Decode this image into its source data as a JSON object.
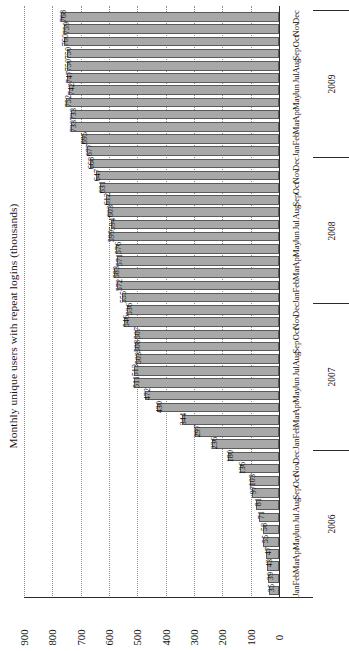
{
  "chart": {
    "type": "bar",
    "orientation": "horizontal-rotated",
    "axis_title": "Monthly unique users with repeat logins (thousands)"
  },
  "axis": {
    "ticks": [
      "0",
      "100",
      "200",
      "300",
      "400",
      "500",
      "600",
      "700",
      "800",
      "900"
    ],
    "min": 0,
    "max": 900,
    "step": 100
  },
  "year_groups": [
    {
      "label": "2006"
    },
    {
      "label": "2007"
    },
    {
      "label": "2008"
    },
    {
      "label": "2009"
    }
  ],
  "colors": {
    "bar_fill": "#a8a8a8",
    "bar_stroke": "#5b5b5b",
    "grid": "#8d8d8d",
    "axis": "#2b2b2b",
    "text": "#111111",
    "background": "#ffffff"
  },
  "chart_data": {
    "type": "bar",
    "title": "",
    "xlabel": "",
    "ylabel": "Monthly unique users with repeat logins (thousands)",
    "ylim": [
      0,
      900
    ],
    "grid": true,
    "legend": "none",
    "categories": [
      "Jan 2006",
      "Feb 2006",
      "Mar 2006",
      "Apr 2006",
      "May 2006",
      "Jun 2006",
      "Jul 2006",
      "Aug 2006",
      "Sep 2006",
      "Oct 2006",
      "Nov 2006",
      "Dec 2006",
      "Jan 2007",
      "Feb 2007",
      "Mar 2007",
      "Apr 2007",
      "May 2007",
      "Jun 2007",
      "Jul 2007",
      "Aug 2007",
      "Sep 2007",
      "Oct 2007",
      "Nov 2007",
      "Dec 2007",
      "Jan 2008",
      "Feb 2008",
      "Mar 2008",
      "Apr 2008",
      "May 2008",
      "Jun 2008",
      "Jul 2008",
      "Aug 2008",
      "Sep 2008",
      "Oct 2008",
      "Nov 2008",
      "Dec 2008",
      "Jan 2009",
      "Feb 2009",
      "Mar 2009",
      "Apr 2009",
      "May 2009",
      "Jun 2009",
      "Jul 2009",
      "Aug 2009",
      "Sep 2009",
      "Oct 2009",
      "Nov 2009",
      "Dec 2009"
    ],
    "values": [
      35,
      39,
      43,
      47,
      55,
      58,
      71,
      81,
      97,
      103,
      136,
      180,
      236,
      297,
      344,
      430,
      472,
      511,
      513,
      503,
      508,
      507,
      546,
      536,
      555,
      572,
      583,
      571,
      576,
      599,
      594,
      603,
      612,
      631,
      647,
      668,
      677,
      695,
      733,
      733,
      752,
      742,
      747,
      750,
      750,
      760,
      759,
      768
    ],
    "months": [
      "Jan",
      "Feb",
      "Mar",
      "Apr",
      "May",
      "Jun",
      "Jul",
      "Aug",
      "Sep",
      "Oct",
      "Nov",
      "Dec"
    ]
  }
}
